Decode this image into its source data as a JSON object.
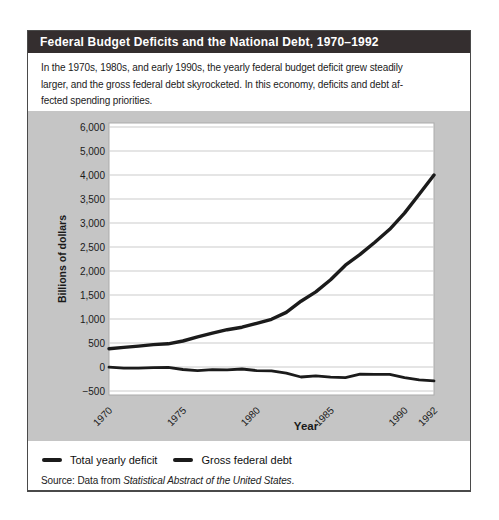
{
  "figure": {
    "title": "Federal Budget Deficits and the National Debt, 1970–1992",
    "intro_lines": [
      "In the 1970s, 1980s, and early 1990s, the yearly federal budget deficit grew steadily",
      "larger, and the gross federal debt skyrocketed. In this economy, deficits and debt af-",
      "fected spending priorities."
    ]
  },
  "legend": {
    "items": [
      {
        "label": "Total yearly deficit"
      },
      {
        "label": "Gross federal debt"
      }
    ]
  },
  "source": {
    "prefix": "Source: Data from ",
    "citation": "Statistical Abstract of the United States",
    "suffix": "."
  },
  "colors": {
    "header_bg": "#342e2f",
    "header_text": "#ffffff",
    "panel_bg": "#c5c5c5",
    "plot_bg": "#ffffff",
    "plot_border": "#ababab",
    "gridline": "#cbcbcb",
    "line": "#1b1b1b",
    "text": "#1a1a1a"
  },
  "chart_data": {
    "type": "line",
    "title": "Federal Budget Deficits and the National Debt, 1970–1992",
    "xlabel": "Year",
    "ylabel": "Billions of dollars",
    "grid": true,
    "legend_position": "bottom",
    "x_tick_years": [
      1970,
      1975,
      1980,
      1985,
      1990,
      1992
    ],
    "x_tick_labels": [
      "1970",
      "1975",
      "1980",
      "1985",
      "1990",
      "1992"
    ],
    "y_ticks": [
      6000,
      5000,
      4000,
      3500,
      3000,
      2500,
      2000,
      1500,
      1000,
      500,
      0,
      -500
    ],
    "y_tick_labels": [
      "6,000",
      "5,000",
      "4,000",
      "3,500",
      "3,000",
      "2,500",
      "2,000",
      "1,500",
      "1,000",
      "500",
      "0",
      "−500"
    ],
    "y_axis_scale_note": "ticks are evenly spaced: 500 per tick up to 4,000, then 1,000 per tick to 6,000",
    "x": [
      1970,
      1971,
      1972,
      1973,
      1974,
      1975,
      1976,
      1977,
      1978,
      1979,
      1980,
      1981,
      1982,
      1983,
      1984,
      1985,
      1986,
      1987,
      1988,
      1989,
      1990,
      1991,
      1992
    ],
    "series": [
      {
        "name": "Total yearly deficit",
        "values": [
          -3,
          -23,
          -23,
          -15,
          -6,
          -53,
          -74,
          -54,
          -59,
          -41,
          -74,
          -79,
          -128,
          -208,
          -185,
          -212,
          -221,
          -150,
          -155,
          -153,
          -221,
          -269,
          -290
        ]
      },
      {
        "name": "Gross federal debt",
        "values": [
          381,
          408,
          436,
          466,
          484,
          541,
          629,
          706,
          777,
          829,
          909,
          994,
          1137,
          1371,
          1565,
          1817,
          2120,
          2346,
          2601,
          2868,
          3206,
          3598,
          4002
        ]
      }
    ]
  }
}
